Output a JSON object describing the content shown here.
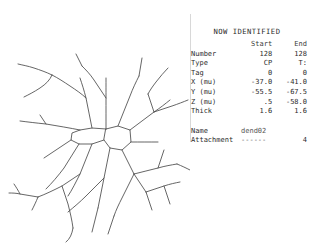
{
  "panel": {
    "title": "NOW IDENTIFIED",
    "columns": [
      "",
      "Start",
      "End"
    ],
    "rows": [
      {
        "label": "Number",
        "start": "128",
        "end": "128"
      },
      {
        "label": "Type",
        "start": "CP",
        "end": "T:"
      },
      {
        "label": "Tag",
        "start": "0",
        "end": "0"
      },
      {
        "label": "X (mu)",
        "start": "-37.0",
        "end": "-41.0"
      },
      {
        "label": "Y (mu)",
        "start": "-55.5",
        "end": "-67.5"
      },
      {
        "label": "Z (mu)",
        "start": ".5",
        "end": "-58.0"
      },
      {
        "label": "Thick",
        "start": "1.6",
        "end": "1.6"
      }
    ],
    "meta": [
      {
        "label": "Name",
        "value": "dend02",
        "trail": ""
      },
      {
        "label": "Attachment",
        "value": "------",
        "trail": "4"
      }
    ]
  },
  "tracing": {
    "name": "neuron-tracing",
    "stroke_color": "#4a4a4a",
    "background_color": "#ffffff",
    "soma_label": "soma-outline"
  }
}
